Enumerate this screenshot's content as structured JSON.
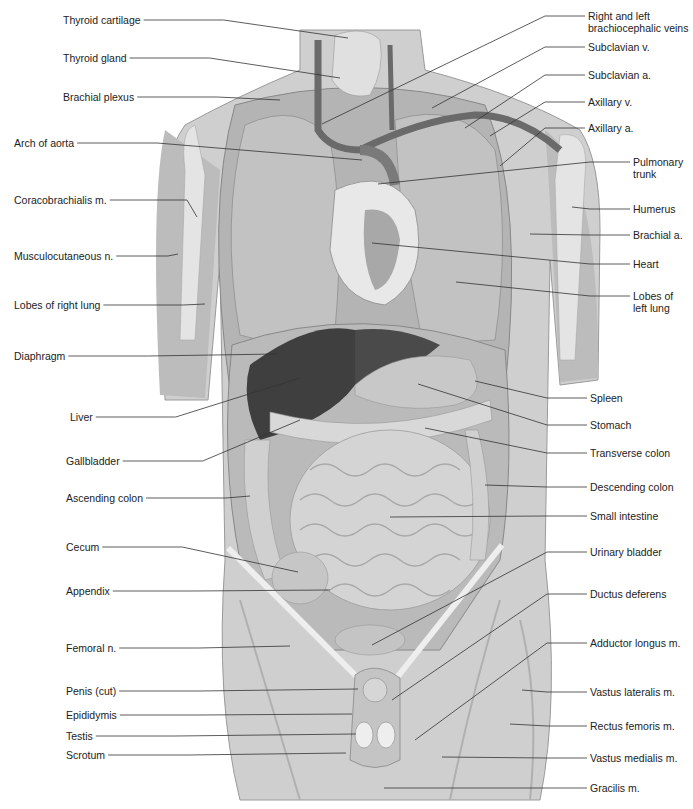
{
  "figure": {
    "colors": {
      "background": "#ffffff",
      "skin": "#cfcfcf",
      "skin_dark": "#a9a9a9",
      "lung": "#bdbdbd",
      "liver": "#3f3f3f",
      "stomach": "#c8c8c8",
      "intestine": "#d2d2d2",
      "heart": "#a0a0a0",
      "vessel": "#6a6a6a",
      "leader_line": "#333333",
      "text": "#222222"
    }
  },
  "labels_left": [
    {
      "id": "thyroid-cartilage",
      "text": "Thyroid cartilage",
      "x": 63,
      "y": 14,
      "tx": 348,
      "ty": 38
    },
    {
      "id": "thyroid-gland",
      "text": "Thyroid gland",
      "x": 63,
      "y": 52,
      "tx": 340,
      "ty": 78
    },
    {
      "id": "brachial-plexus",
      "text": "Brachial plexus",
      "x": 63,
      "y": 91,
      "tx": 280,
      "ty": 100
    },
    {
      "id": "arch-of-aorta",
      "text": "Arch of aorta",
      "x": 14,
      "y": 137,
      "tx": 362,
      "ty": 160
    },
    {
      "id": "coracobrachialis",
      "text": "Coracobrachialis m.",
      "x": 14,
      "y": 194,
      "tx": 197,
      "ty": 217
    },
    {
      "id": "musculocutaneous",
      "text": "Musculocutaneous n.",
      "x": 14,
      "y": 250,
      "tx": 178,
      "ty": 254
    },
    {
      "id": "lobes-right-lung",
      "text": "Lobes of right lung",
      "x": 14,
      "y": 299,
      "tx": 205,
      "ty": 304
    },
    {
      "id": "diaphragm",
      "text": "Diaphragm",
      "x": 14,
      "y": 350,
      "tx": 278,
      "ty": 354
    },
    {
      "id": "liver",
      "text": "Liver",
      "x": 70,
      "y": 411,
      "tx": 300,
      "ty": 378
    },
    {
      "id": "gallbladder",
      "text": "Gallbladder",
      "x": 66,
      "y": 455,
      "tx": 300,
      "ty": 420
    },
    {
      "id": "ascending-colon",
      "text": "Ascending colon",
      "x": 66,
      "y": 492,
      "tx": 250,
      "ty": 496
    },
    {
      "id": "cecum",
      "text": "Cecum",
      "x": 66,
      "y": 541,
      "tx": 298,
      "ty": 572
    },
    {
      "id": "appendix",
      "text": "Appendix",
      "x": 66,
      "y": 585,
      "tx": 330,
      "ty": 590
    },
    {
      "id": "femoral-n",
      "text": "Femoral n.",
      "x": 66,
      "y": 642,
      "tx": 290,
      "ty": 646
    },
    {
      "id": "penis-cut",
      "text": "Penis (cut)",
      "x": 66,
      "y": 685,
      "tx": 358,
      "ty": 689
    },
    {
      "id": "epididymis",
      "text": "Epididymis",
      "x": 66,
      "y": 709,
      "tx": 352,
      "ty": 714
    },
    {
      "id": "testis",
      "text": "Testis",
      "x": 66,
      "y": 730,
      "tx": 356,
      "ty": 734
    },
    {
      "id": "scrotum",
      "text": "Scrotum",
      "x": 66,
      "y": 749,
      "tx": 346,
      "ty": 753
    }
  ],
  "labels_right": [
    {
      "id": "brachiocephalic-veins",
      "text": "Right and left",
      "text2": "brachiocephalic veins",
      "x": 588,
      "y": 10,
      "tx": 322,
      "ty": 124
    },
    {
      "id": "subclavian-v",
      "text": "Subclavian v.",
      "x": 588,
      "y": 41,
      "tx": 432,
      "ty": 108
    },
    {
      "id": "subclavian-a",
      "text": "Subclavian a.",
      "x": 588,
      "y": 69,
      "tx": 465,
      "ty": 128
    },
    {
      "id": "axillary-v",
      "text": "Axillary v.",
      "x": 588,
      "y": 96,
      "tx": 490,
      "ty": 136
    },
    {
      "id": "axillary-a",
      "text": "Axillary a.",
      "x": 588,
      "y": 122,
      "tx": 500,
      "ty": 166
    },
    {
      "id": "pulmonary-trunk",
      "text": "Pulmonary",
      "text2": "trunk",
      "x": 633,
      "y": 156,
      "tx": 378,
      "ty": 184
    },
    {
      "id": "humerus",
      "text": "Humerus",
      "x": 633,
      "y": 203,
      "tx": 572,
      "ty": 207
    },
    {
      "id": "brachial-a",
      "text": "Brachial a.",
      "x": 633,
      "y": 229,
      "tx": 530,
      "ty": 234
    },
    {
      "id": "heart",
      "text": "Heart",
      "x": 633,
      "y": 258,
      "tx": 372,
      "ty": 243
    },
    {
      "id": "lobes-left-lung",
      "text": "Lobes of",
      "text2": "left lung",
      "x": 633,
      "y": 290,
      "tx": 456,
      "ty": 282
    },
    {
      "id": "spleen",
      "text": "Spleen",
      "x": 590,
      "y": 392,
      "tx": 475,
      "ty": 381
    },
    {
      "id": "stomach",
      "text": "Stomach",
      "x": 590,
      "y": 419,
      "tx": 418,
      "ty": 384
    },
    {
      "id": "transverse-colon",
      "text": "Transverse colon",
      "x": 590,
      "y": 447,
      "tx": 425,
      "ty": 428
    },
    {
      "id": "descending-colon",
      "text": "Descending colon",
      "x": 590,
      "y": 481,
      "tx": 485,
      "ty": 485
    },
    {
      "id": "small-intestine",
      "text": "Small intestine",
      "x": 590,
      "y": 510,
      "tx": 390,
      "ty": 517
    },
    {
      "id": "urinary-bladder",
      "text": "Urinary bladder",
      "x": 590,
      "y": 546,
      "tx": 372,
      "ty": 645
    },
    {
      "id": "ductus-deferens",
      "text": "Ductus deferens",
      "x": 590,
      "y": 588,
      "tx": 392,
      "ty": 700
    },
    {
      "id": "adductor-longus",
      "text": "Adductor longus m.",
      "x": 590,
      "y": 637,
      "tx": 415,
      "ty": 740
    },
    {
      "id": "vastus-lateralis",
      "text": "Vastus lateralis m.",
      "x": 590,
      "y": 686,
      "tx": 522,
      "ty": 690
    },
    {
      "id": "rectus-femoris",
      "text": "Rectus femoris m.",
      "x": 590,
      "y": 720,
      "tx": 510,
      "ty": 724
    },
    {
      "id": "vastus-medialis",
      "text": "Vastus medialis m.",
      "x": 590,
      "y": 752,
      "tx": 442,
      "ty": 757
    },
    {
      "id": "gracilis",
      "text": "Gracilis m.",
      "x": 590,
      "y": 782,
      "tx": 384,
      "ty": 788
    }
  ]
}
